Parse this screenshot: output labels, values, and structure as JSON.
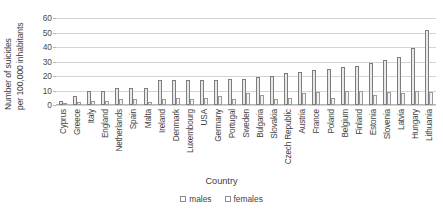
{
  "chart_data": {
    "type": "bar",
    "title": "",
    "xlabel": "Country",
    "ylabel": "Number of suicides per 100,000 inhabitants",
    "ylabel_lines": [
      "Number of suicides",
      "per 100,000 inhabitants"
    ],
    "ylim": [
      0,
      60
    ],
    "yticks": [
      0,
      10,
      20,
      30,
      40,
      50,
      60
    ],
    "grid": true,
    "legend_position": "bottom",
    "categories": [
      "Cyprus",
      "Greece",
      "Italy",
      "England",
      "Netherlands",
      "Spain",
      "Malta",
      "Ireland",
      "Denmark",
      "Luxembourg",
      "USA",
      "Germany",
      "Portugal",
      "Sweden",
      "Bulgaria",
      "Slovakia",
      "Czech Republic",
      "Austria",
      "France",
      "Poland",
      "Belgium",
      "Finland",
      "Estonia",
      "Slovenia",
      "Latvia",
      "Hungary",
      "Lithuania"
    ],
    "series": [
      {
        "name": "males",
        "color": "#e8e8e8",
        "values": [
          3,
          6,
          10,
          10,
          12,
          12,
          12,
          17,
          17,
          17,
          17,
          17,
          18,
          18,
          19,
          20,
          22,
          23,
          24,
          25,
          26,
          27,
          29,
          31,
          33,
          39,
          52
        ]
      },
      {
        "name": "females",
        "color": "#f4f4f4",
        "values": [
          1,
          2,
          3,
          3,
          4,
          4,
          2,
          4,
          5,
          4,
          5,
          6,
          4,
          8,
          7,
          4,
          5,
          8,
          9,
          5,
          10,
          10,
          7,
          9,
          8,
          10,
          9
        ]
      }
    ]
  },
  "legend": {
    "items": [
      {
        "label": "males"
      },
      {
        "label": "females"
      }
    ]
  },
  "axes": {
    "x_title": "Country"
  }
}
